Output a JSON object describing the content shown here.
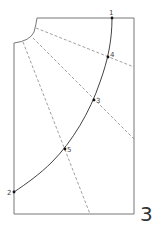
{
  "figure": {
    "number": "3",
    "points": [
      {
        "id": "1",
        "label": "1"
      },
      {
        "id": "2",
        "label": "2"
      },
      {
        "id": "3",
        "label": "3"
      },
      {
        "id": "4",
        "label": "4"
      },
      {
        "id": "5",
        "label": "5"
      }
    ],
    "colors": {
      "outline": "#777777",
      "curve": "#444444",
      "dash": "#888888",
      "point": "#111111"
    }
  }
}
